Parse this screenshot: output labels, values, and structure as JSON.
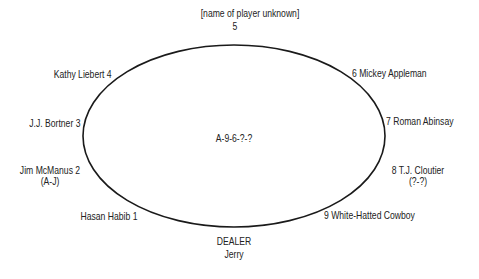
{
  "diagram": {
    "type": "poker-table-seating",
    "board": "A-9-6-?-?",
    "dealer": {
      "label": "DEALER",
      "name": "Jerry"
    },
    "seats": [
      {
        "seat": "1",
        "name": "Hasan Habib 1"
      },
      {
        "seat": "2",
        "name": "Jim McManus 2",
        "hand": "(A-J)"
      },
      {
        "seat": "3",
        "name": "J.J. Bortner 3"
      },
      {
        "seat": "4",
        "name": "Kathy Liebert 4"
      },
      {
        "seat": "5",
        "name": "[name of player unknown]",
        "number": "5"
      },
      {
        "seat": "6",
        "name": "6 Mickey Appleman"
      },
      {
        "seat": "7",
        "name": "7 Roman Abinsay"
      },
      {
        "seat": "8",
        "name": "8 T.J. Cloutier",
        "hand": "(?-?)"
      },
      {
        "seat": "9",
        "name": "9 White-Hatted Cowboy"
      }
    ],
    "colors": {
      "line": "#1a1a1a",
      "text": "#222222",
      "background": "#ffffff"
    }
  }
}
